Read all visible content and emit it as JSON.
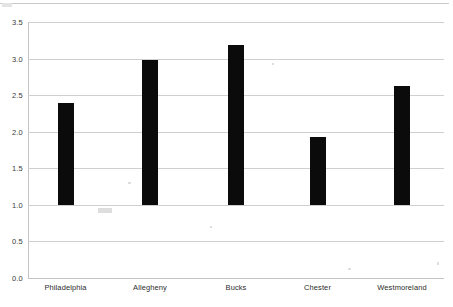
{
  "chart_data": {
    "type": "bar",
    "title": "",
    "subtitle": "",
    "xlabel": "",
    "ylabel": "",
    "categories": [
      "Philadelphia",
      "Allegheny",
      "Bucks",
      "Chester",
      "Westmoreland"
    ],
    "values": [
      2.39,
      2.98,
      3.19,
      1.93,
      2.62
    ],
    "series": [
      {
        "name": "",
        "values": [
          2.39,
          2.98,
          3.19,
          1.93,
          2.62
        ]
      }
    ],
    "ylim": [
      0.0,
      3.5
    ],
    "bar_baseline": 1.0,
    "ytick_labels": [
      "0.0",
      "0.5",
      "1.0",
      "1.5",
      "2.0",
      "2.5",
      "3.0",
      "3.5"
    ],
    "ytick_values": [
      0.0,
      0.5,
      1.0,
      1.5,
      2.0,
      2.5,
      3.0,
      3.5
    ],
    "grid": true,
    "grid_axis": "y",
    "legend": false,
    "legend_position": "none",
    "annotations": [],
    "colors": {
      "bar": "#0b0b0b",
      "gridline": "#cfcfcf",
      "axis": "#c4c4c4",
      "tick_label": "#3b3b3b",
      "category_label": "#2e2e2e",
      "background": "#ffffff"
    }
  }
}
